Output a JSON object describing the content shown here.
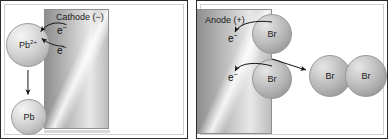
{
  "diagram": {
    "type": "electrochemistry-diagram",
    "panels": [
      {
        "id": "cathode-panel",
        "electrode": {
          "label": "Cathode (−)",
          "polarity": "negative"
        },
        "species": [
          {
            "name": "lead-ion",
            "label": "Pb",
            "charge": "2+"
          },
          {
            "name": "lead-metal",
            "label": "Pb",
            "charge": ""
          }
        ],
        "electrons": [
          {
            "label": "e",
            "charge": "−"
          },
          {
            "label": "e",
            "charge": "−"
          }
        ]
      },
      {
        "id": "anode-panel",
        "electrode": {
          "label": "Anode (+)",
          "polarity": "positive"
        },
        "species": [
          {
            "name": "bromide-ion-1",
            "label": "Br"
          },
          {
            "name": "bromide-ion-2",
            "label": "Br"
          },
          {
            "name": "bromine-atom-1",
            "label": "Br"
          },
          {
            "name": "bromine-atom-2",
            "label": "Br"
          }
        ],
        "electrons": [
          {
            "label": "e",
            "charge": "−"
          },
          {
            "label": "e",
            "charge": "−"
          }
        ]
      }
    ],
    "colors": {
      "frame": "#2b2b2b",
      "electrode_light": "#e8e8e8",
      "electrode_dark": "#8e8e8e",
      "sphere_fill": "#c9c9c9",
      "arrow": "#1a1a1a",
      "background": "#ffffff"
    }
  }
}
